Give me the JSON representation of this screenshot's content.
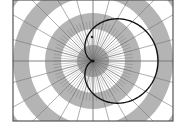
{
  "diagram": {
    "type": "polar-grid-with-curve",
    "frame": {
      "x": 13,
      "y": 0,
      "width": 160,
      "height": 121,
      "stroke": "#555555"
    },
    "center": {
      "x": 93,
      "y": 61
    },
    "rings": {
      "width": 16,
      "count": 8,
      "fill_a": "#b4b4b4",
      "fill_b": "#ffffff"
    },
    "spokes": {
      "count": 24,
      "color": "#777777"
    },
    "inner_spokes": {
      "count": 72,
      "radius": 40,
      "color": "#666666"
    },
    "curve": {
      "name": "cardioid",
      "equation": "r = a(1 + cos θ)",
      "a": 32.5,
      "stroke": "#111111",
      "stroke_width": 1.4
    },
    "marker": {
      "x": 92,
      "y": 37,
      "color": "#222222"
    }
  }
}
